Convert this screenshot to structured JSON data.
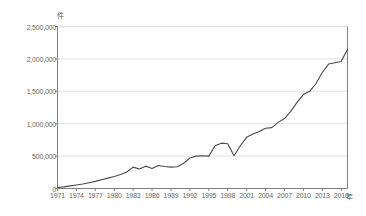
{
  "chart_data": {
    "type": "line",
    "title": "",
    "xlabel": "年",
    "ylabel": "件",
    "xlim": [
      1971,
      2017
    ],
    "ylim": [
      0,
      2500000
    ],
    "grid": true,
    "legend": "none",
    "line_color": "#4a4a4a",
    "grid_color": "#d9d9d9",
    "axis_color": "#808080",
    "y_ticks": [
      "0",
      "500,000",
      "1,000,000",
      "1,500,000",
      "2,000,000",
      "2,500,000"
    ],
    "y_tick_values": [
      0,
      500000,
      1000000,
      1500000,
      2000000,
      2500000
    ],
    "x_ticks": [
      "1971",
      "1974",
      "1977",
      "1980",
      "1983",
      "1986",
      "1989",
      "1992",
      "1995",
      "1998",
      "2001",
      "2004",
      "2007",
      "2010",
      "2013",
      "2016"
    ],
    "x_tick_values": [
      1971,
      1974,
      1977,
      1980,
      1983,
      1986,
      1989,
      1992,
      1995,
      1998,
      2001,
      2004,
      2007,
      2010,
      2013,
      2016
    ],
    "x": [
      1971,
      1972,
      1973,
      1974,
      1975,
      1976,
      1977,
      1978,
      1979,
      1980,
      1981,
      1982,
      1983,
      1984,
      1985,
      1986,
      1987,
      1988,
      1989,
      1990,
      1991,
      1992,
      1993,
      1994,
      1995,
      1996,
      1997,
      1998,
      1999,
      2000,
      2001,
      2002,
      2003,
      2004,
      2005,
      2006,
      2007,
      2008,
      2009,
      2010,
      2011,
      2012,
      2013,
      2014,
      2015,
      2016,
      2017
    ],
    "values": [
      15000,
      25000,
      40000,
      55000,
      70000,
      90000,
      110000,
      135000,
      160000,
      185000,
      215000,
      255000,
      330000,
      300000,
      345000,
      310000,
      355000,
      340000,
      330000,
      335000,
      390000,
      470000,
      500000,
      505000,
      500000,
      660000,
      700000,
      690000,
      505000,
      660000,
      790000,
      840000,
      880000,
      930000,
      940000,
      1020000,
      1080000,
      1190000,
      1330000,
      1450000,
      1500000,
      1620000,
      1790000,
      1920000,
      1940000,
      1960000,
      2150000
    ]
  }
}
